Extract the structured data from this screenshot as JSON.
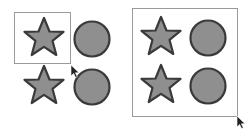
{
  "colors": {
    "shape_fill": "#8f8f8f",
    "shape_stroke": "#3a3a3a",
    "frame_stroke": "#9a9a9a",
    "background": "#ffffff"
  },
  "left_panel": {
    "selection_box": {
      "x": 14,
      "y": 12,
      "w": 56,
      "h": 51
    },
    "cursor": {
      "x": 71,
      "y": 65
    },
    "shapes": [
      {
        "type": "star",
        "cx": 44,
        "cy": 38
      },
      {
        "type": "circle",
        "cx": 92,
        "cy": 39
      },
      {
        "type": "star",
        "cx": 44,
        "cy": 86
      },
      {
        "type": "circle",
        "cx": 92,
        "cy": 87
      }
    ]
  },
  "right_panel": {
    "selection_box": {
      "x": 132,
      "y": 8,
      "w": 105,
      "h": 108
    },
    "cursor": {
      "x": 237,
      "y": 116
    },
    "shapes": [
      {
        "type": "star",
        "cx": 161,
        "cy": 37
      },
      {
        "type": "circle",
        "cx": 208,
        "cy": 38
      },
      {
        "type": "star",
        "cx": 161,
        "cy": 85
      },
      {
        "type": "circle",
        "cx": 208,
        "cy": 86
      }
    ]
  }
}
